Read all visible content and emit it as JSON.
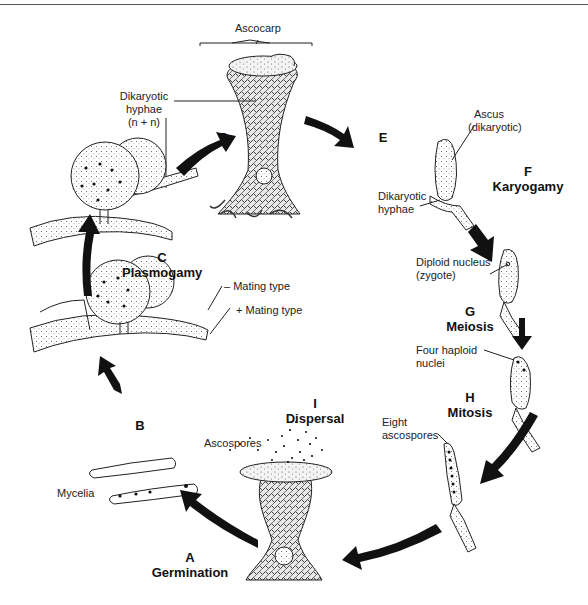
{
  "diagram": {
    "type": "life-cycle",
    "structure_labels": {
      "ascocarp": "Ascocarp",
      "dikaryotic_hyphae_top": "Dikaryotic hyphae (n + n)",
      "dikaryotic_hyphae_top_l1": "Dikaryotic",
      "dikaryotic_hyphae_top_l2": "hyphae",
      "dikaryotic_hyphae_top_l3": "(n + n)",
      "ascus_l1": "Ascus",
      "ascus_l2": "(dikaryotic)",
      "dikaryotic_hyphae_right_l1": "Dikaryotic",
      "dikaryotic_hyphae_right_l2": "hyphae",
      "diploid_l1": "Diploid nucleus",
      "diploid_l2": "(zygote)",
      "four_haploid_l1": "Four haploid",
      "four_haploid_l2": "nuclei",
      "eight_ascospores_l1": "Eight",
      "eight_ascospores_l2": "ascospores",
      "ascospores": "Ascospores",
      "mycelia": "Mycelia",
      "minus_mating": "– Mating type",
      "plus_mating": "+ Mating type"
    },
    "steps": [
      {
        "letter": "A",
        "name": "Germination"
      },
      {
        "letter": "B",
        "name": ""
      },
      {
        "letter": "C",
        "name": "Plasmogamy"
      },
      {
        "letter": "D",
        "name": ""
      },
      {
        "letter": "E",
        "name": ""
      },
      {
        "letter": "F",
        "name": "Karyogamy"
      },
      {
        "letter": "G",
        "name": "Meiosis"
      },
      {
        "letter": "H",
        "name": "Mitosis"
      },
      {
        "letter": "I",
        "name": "Dispersal"
      }
    ],
    "nodes": [
      {
        "id": "ascocarp",
        "label": "Ascocarp"
      },
      {
        "id": "ascus-dikaryotic",
        "label": "Ascus (dikaryotic)"
      },
      {
        "id": "diploid-zygote",
        "label": "Diploid nucleus (zygote)"
      },
      {
        "id": "four-haploid",
        "label": "Four haploid nuclei"
      },
      {
        "id": "eight-ascospores",
        "label": "Eight ascospores"
      },
      {
        "id": "dispersal-ascocarp",
        "label": "Ascospores"
      },
      {
        "id": "mycelia",
        "label": "Mycelia"
      },
      {
        "id": "mating-types",
        "label": "– / + Mating type"
      },
      {
        "id": "plasmogamy",
        "label": "Dikaryotic hyphae (n + n)"
      }
    ],
    "edges": [
      {
        "from": "plasmogamy",
        "to": "ascocarp",
        "step": "D"
      },
      {
        "from": "ascocarp",
        "to": "ascus-dikaryotic",
        "step": "E"
      },
      {
        "from": "ascus-dikaryotic",
        "to": "diploid-zygote",
        "step": "F"
      },
      {
        "from": "diploid-zygote",
        "to": "four-haploid",
        "step": "G"
      },
      {
        "from": "four-haploid",
        "to": "eight-ascospores",
        "step": "H"
      },
      {
        "from": "eight-ascospores",
        "to": "dispersal-ascocarp",
        "step": "I"
      },
      {
        "from": "dispersal-ascocarp",
        "to": "mycelia",
        "step": "A"
      },
      {
        "from": "mycelia",
        "to": "mating-types",
        "step": "B"
      },
      {
        "from": "mating-types",
        "to": "plasmogamy",
        "step": "C"
      }
    ],
    "colors": {
      "ink": "#1a1a1a",
      "background": "#ffffff",
      "texture": "#555555"
    }
  }
}
